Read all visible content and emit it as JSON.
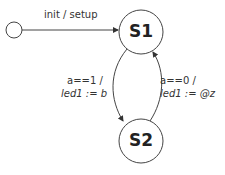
{
  "diagram": {
    "type": "state-machine",
    "initial": {
      "label": ""
    },
    "states": [
      {
        "id": "S1",
        "label": "S1"
      },
      {
        "id": "S2",
        "label": "S2"
      }
    ],
    "transitions": [
      {
        "from": "initial",
        "to": "S1",
        "label": "init / setup"
      },
      {
        "from": "S1",
        "to": "S2",
        "guard": "a==1 /",
        "action": "led1 := b"
      },
      {
        "from": "S2",
        "to": "S1",
        "guard": "a==0 /",
        "action": "led1 := @z"
      }
    ]
  }
}
